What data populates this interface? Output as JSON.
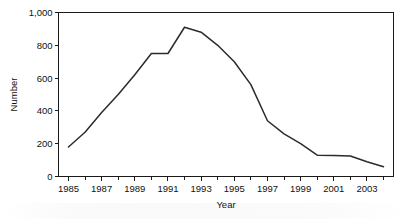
{
  "chart_data": {
    "type": "line",
    "title": "",
    "xlabel": "Year",
    "ylabel": "Number",
    "xlim": [
      1984.4,
      2004.6
    ],
    "ylim": [
      0,
      1000
    ],
    "grid": false,
    "legend": null,
    "x": [
      1985,
      1986,
      1987,
      1988,
      1989,
      1990,
      1991,
      1992,
      1993,
      1994,
      1995,
      1996,
      1997,
      1998,
      1999,
      2000,
      2001,
      2002,
      2003,
      2004
    ],
    "values": [
      180,
      270,
      390,
      500,
      620,
      750,
      750,
      910,
      880,
      800,
      700,
      560,
      340,
      260,
      200,
      130,
      128,
      125,
      90,
      60
    ],
    "series": [
      {
        "name": "Number",
        "values": [
          180,
          270,
          390,
          500,
          620,
          750,
          750,
          910,
          880,
          800,
          700,
          560,
          340,
          260,
          200,
          130,
          128,
          125,
          90,
          60
        ],
        "color": "#2b2b2b"
      }
    ],
    "y_ticks": [
      0,
      200,
      400,
      600,
      800,
      1000
    ],
    "y_tick_labels": [
      "0",
      "200",
      "400",
      "600",
      "800",
      "1,000"
    ],
    "x_major_ticks": [
      1985,
      1987,
      1989,
      1991,
      1993,
      1995,
      1997,
      1999,
      2001,
      2003
    ],
    "x_major_tick_labels": [
      "1985",
      "1987",
      "1989",
      "1991",
      "1993",
      "1995",
      "1997",
      "1999",
      "2001",
      "2003"
    ],
    "x_minor_ticks": [
      1986,
      1988,
      1990,
      1992,
      1994,
      1996,
      1998,
      2000,
      2002,
      2004
    ]
  }
}
